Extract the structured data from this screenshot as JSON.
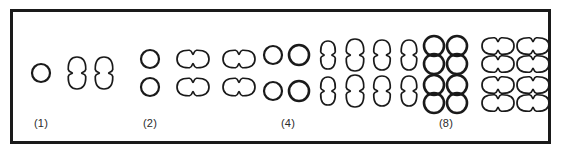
{
  "figure": {
    "caption_labels": [
      {
        "text": "(1)",
        "x": 41,
        "y": 117
      },
      {
        "text": "(2)",
        "x": 150,
        "y": 117
      },
      {
        "text": "(4)",
        "x": 288,
        "y": 117
      },
      {
        "text": "(8)",
        "x": 446,
        "y": 117
      }
    ],
    "frame": {
      "x": 10,
      "y": 9,
      "width": 541,
      "height": 135,
      "border_color": "#1a1a1a",
      "border_width": 3,
      "background": "#ffffff"
    },
    "stroke_color": "#1a1a1a",
    "background_color": "#ffffff"
  },
  "chart_data": {
    "type": "diagram",
    "title": "",
    "shape_kinds": [
      "circle",
      "dumbbell-vertical",
      "dumbbell-horizontal"
    ],
    "groups": [
      {
        "label": "(1)",
        "count": 1,
        "label_x": 41,
        "clusters": [
          {
            "name": "single-circle",
            "shape": "circle",
            "rows": 1,
            "cols": 1,
            "cells": [
              {
                "cx": 41,
                "cy": 73,
                "r": 9
              }
            ]
          },
          {
            "name": "vertical-dumbbell-a",
            "shape": "dumbbell-vertical",
            "rows": 1,
            "cols": 1,
            "cells": [
              {
                "cx": 77,
                "cy": 73,
                "w": 18,
                "h": 32
              }
            ]
          },
          {
            "name": "vertical-dumbbell-b",
            "shape": "dumbbell-vertical",
            "rows": 1,
            "cols": 1,
            "cells": [
              {
                "cx": 104,
                "cy": 73,
                "w": 18,
                "h": 32
              }
            ]
          }
        ]
      },
      {
        "label": "(2)",
        "count": 2,
        "label_x": 150,
        "clusters": [
          {
            "name": "two-circles",
            "shape": "circle",
            "rows": 2,
            "cols": 1,
            "cells": [
              {
                "cx": 150,
                "cy": 59,
                "r": 9
              },
              {
                "cx": 150,
                "cy": 87,
                "r": 9
              }
            ]
          },
          {
            "name": "horizontal-dumbbells-a",
            "shape": "dumbbell-horizontal",
            "rows": 2,
            "cols": 1,
            "cells": [
              {
                "cx": 193,
                "cy": 59,
                "w": 32,
                "h": 18
              },
              {
                "cx": 193,
                "cy": 87,
                "w": 32,
                "h": 18
              }
            ]
          },
          {
            "name": "horizontal-dumbbells-b",
            "shape": "dumbbell-horizontal",
            "rows": 2,
            "cols": 1,
            "cells": [
              {
                "cx": 239,
                "cy": 59,
                "w": 32,
                "h": 18
              },
              {
                "cx": 239,
                "cy": 87,
                "w": 32,
                "h": 18
              }
            ]
          }
        ]
      },
      {
        "label": "(4)",
        "count": 4,
        "label_x": 288,
        "clusters": [
          {
            "name": "four-circles",
            "shape": "circle",
            "rows": 2,
            "cols": 2,
            "cells": [
              {
                "cx": 273,
                "cy": 55,
                "r": 9
              },
              {
                "cx": 299,
                "cy": 55,
                "r": 10
              },
              {
                "cx": 273,
                "cy": 91,
                "r": 9
              },
              {
                "cx": 299,
                "cy": 91,
                "r": 10
              }
            ]
          },
          {
            "name": "vertical-dumbbell-col-1",
            "shape": "dumbbell-vertical",
            "rows": 2,
            "cols": 1,
            "cells": [
              {
                "cx": 328,
                "cy": 55,
                "w": 15,
                "h": 28
              },
              {
                "cx": 328,
                "cy": 91,
                "w": 15,
                "h": 28
              }
            ]
          },
          {
            "name": "vertical-dumbbell-col-2",
            "shape": "dumbbell-vertical",
            "rows": 2,
            "cols": 1,
            "cells": [
              {
                "cx": 355,
                "cy": 55,
                "w": 18,
                "h": 32
              },
              {
                "cx": 355,
                "cy": 91,
                "w": 18,
                "h": 32
              }
            ]
          },
          {
            "name": "vertical-dumbbell-col-3",
            "shape": "dumbbell-vertical",
            "rows": 2,
            "cols": 1,
            "cells": [
              {
                "cx": 382,
                "cy": 55,
                "w": 17,
                "h": 30
              },
              {
                "cx": 382,
                "cy": 91,
                "w": 17,
                "h": 30
              }
            ]
          },
          {
            "name": "vertical-dumbbell-col-4",
            "shape": "dumbbell-vertical",
            "rows": 2,
            "cols": 1,
            "cells": [
              {
                "cx": 409,
                "cy": 55,
                "w": 16,
                "h": 30
              },
              {
                "cx": 409,
                "cy": 91,
                "w": 16,
                "h": 30
              }
            ]
          }
        ]
      },
      {
        "label": "(8)",
        "count": 8,
        "label_x": 446,
        "clusters": [
          {
            "name": "eight-circles",
            "shape": "circle",
            "rows": 4,
            "cols": 2,
            "cells": [
              {
                "cx": 434,
                "cy": 46,
                "r": 10
              },
              {
                "cx": 457,
                "cy": 46,
                "r": 10
              },
              {
                "cx": 434,
                "cy": 64,
                "r": 10
              },
              {
                "cx": 457,
                "cy": 64,
                "r": 10
              },
              {
                "cx": 434,
                "cy": 85,
                "r": 10
              },
              {
                "cx": 457,
                "cy": 85,
                "r": 10
              },
              {
                "cx": 434,
                "cy": 103,
                "r": 10
              },
              {
                "cx": 457,
                "cy": 103,
                "r": 10
              }
            ]
          },
          {
            "name": "eight-horizontal-dumbbells",
            "shape": "dumbbell-horizontal",
            "rows": 4,
            "cols": 2,
            "cells": [
              {
                "cx": 498,
                "cy": 46,
                "w": 32,
                "h": 17
              },
              {
                "cx": 533,
                "cy": 46,
                "w": 32,
                "h": 17
              },
              {
                "cx": 498,
                "cy": 64,
                "w": 32,
                "h": 17
              },
              {
                "cx": 533,
                "cy": 64,
                "w": 32,
                "h": 17
              },
              {
                "cx": 498,
                "cy": 85,
                "w": 32,
                "h": 17
              },
              {
                "cx": 533,
                "cy": 85,
                "w": 32,
                "h": 17
              },
              {
                "cx": 498,
                "cy": 103,
                "w": 32,
                "h": 17
              },
              {
                "cx": 533,
                "cy": 103,
                "w": 32,
                "h": 17
              }
            ]
          }
        ]
      }
    ]
  }
}
